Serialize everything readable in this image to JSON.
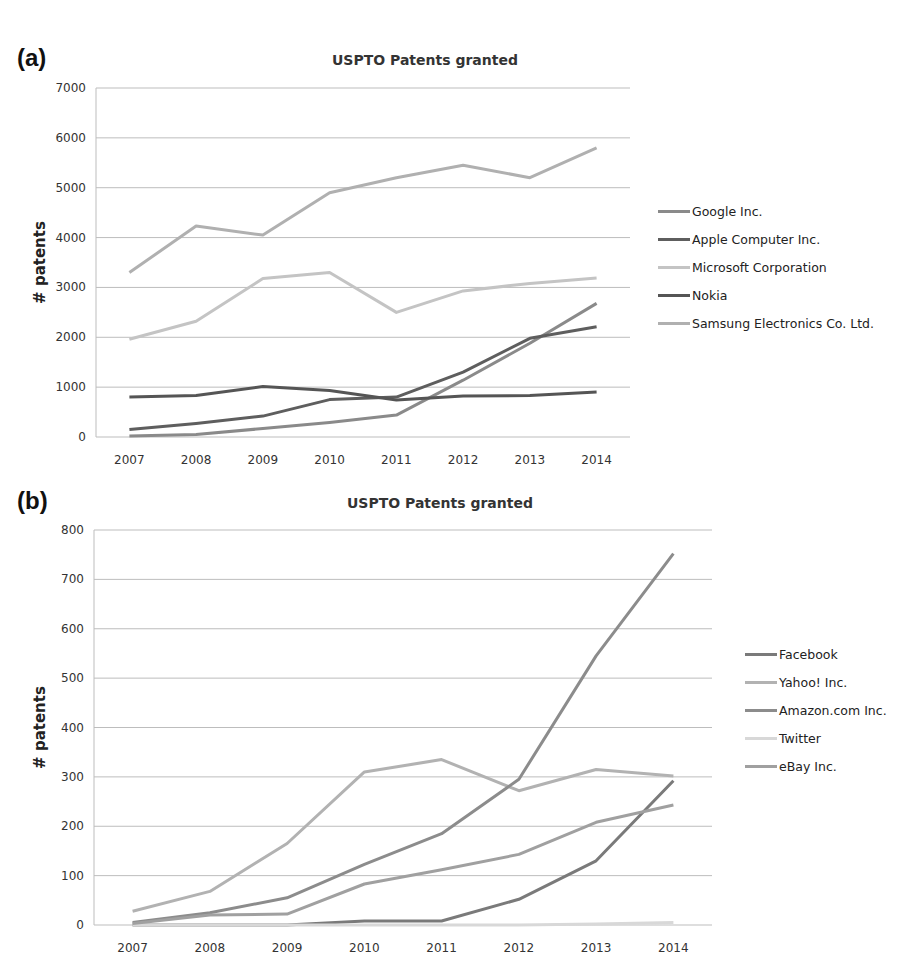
{
  "panels": {
    "a": {
      "label": "(a)"
    },
    "b": {
      "label": "(b)"
    }
  },
  "chart_data": [
    {
      "id": "a",
      "type": "line",
      "title": "USPTO Patents granted",
      "xlabel": "",
      "ylabel": "# patents",
      "categories": [
        "2007",
        "2008",
        "2009",
        "2010",
        "2011",
        "2012",
        "2013",
        "2014"
      ],
      "yticks": [
        "0",
        "1000",
        "2000",
        "3000",
        "4000",
        "5000",
        "6000",
        "7000"
      ],
      "ylim": [
        0,
        7000
      ],
      "grid": true,
      "legend_position": "right",
      "series": [
        {
          "name": "Google Inc.",
          "color": "#8a8a8a",
          "values": [
            20,
            50,
            170,
            290,
            440,
            1140,
            1880,
            2680
          ]
        },
        {
          "name": "Apple Computer Inc.",
          "color": "#5e5e5e",
          "values": [
            150,
            270,
            420,
            750,
            800,
            1300,
            1980,
            2210
          ]
        },
        {
          "name": "Microsoft Corporation",
          "color": "#c4c4c4",
          "values": [
            1960,
            2320,
            3180,
            3300,
            2500,
            2930,
            3080,
            3190
          ]
        },
        {
          "name": "Nokia",
          "color": "#555555",
          "values": [
            800,
            830,
            1010,
            930,
            740,
            820,
            830,
            900
          ]
        },
        {
          "name": "Samsung Electronics Co. Ltd.",
          "color": "#b0b0b0",
          "values": [
            3300,
            4230,
            4050,
            4900,
            5200,
            5450,
            5200,
            5800
          ]
        }
      ]
    },
    {
      "id": "b",
      "type": "line",
      "title": "USPTO Patents granted",
      "xlabel": "",
      "ylabel": "# patents",
      "categories": [
        "2007",
        "2008",
        "2009",
        "2010",
        "2011",
        "2012",
        "2013",
        "2014"
      ],
      "yticks": [
        "0",
        "100",
        "200",
        "300",
        "400",
        "500",
        "600",
        "700",
        "800"
      ],
      "ylim": [
        0,
        800
      ],
      "grid": true,
      "legend_position": "right",
      "series": [
        {
          "name": "Facebook",
          "color": "#7a7a7a",
          "values": [
            0,
            0,
            0,
            8,
            8,
            52,
            130,
            292
          ]
        },
        {
          "name": "Yahoo! Inc.",
          "color": "#b2b2b2",
          "values": [
            28,
            68,
            165,
            310,
            335,
            272,
            315,
            302
          ]
        },
        {
          "name": "Amazon.com Inc.",
          "color": "#8c8c8c",
          "values": [
            5,
            25,
            55,
            123,
            185,
            295,
            545,
            752
          ]
        },
        {
          "name": "Twitter",
          "color": "#d8d8d8",
          "values": [
            0,
            0,
            0,
            0,
            0,
            0,
            2,
            5
          ]
        },
        {
          "name": "eBay Inc.",
          "color": "#a0a0a0",
          "values": [
            3,
            20,
            22,
            83,
            112,
            143,
            208,
            243
          ]
        }
      ]
    }
  ]
}
